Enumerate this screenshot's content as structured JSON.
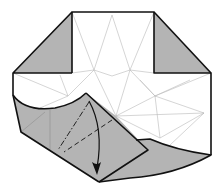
{
  "diagram": {
    "type": "origami-fold-step",
    "colors": {
      "paper_front": "#ffffff",
      "paper_back": "#b4b4b4",
      "edge": "#111111",
      "crease": "#b8b8b8"
    },
    "fold_lines": [
      {
        "kind": "mountain-fold",
        "style": "dash-dot"
      },
      {
        "kind": "valley-fold",
        "style": "dashed"
      }
    ],
    "arrow": {
      "meaning": "fold-down",
      "direction": "down"
    }
  }
}
